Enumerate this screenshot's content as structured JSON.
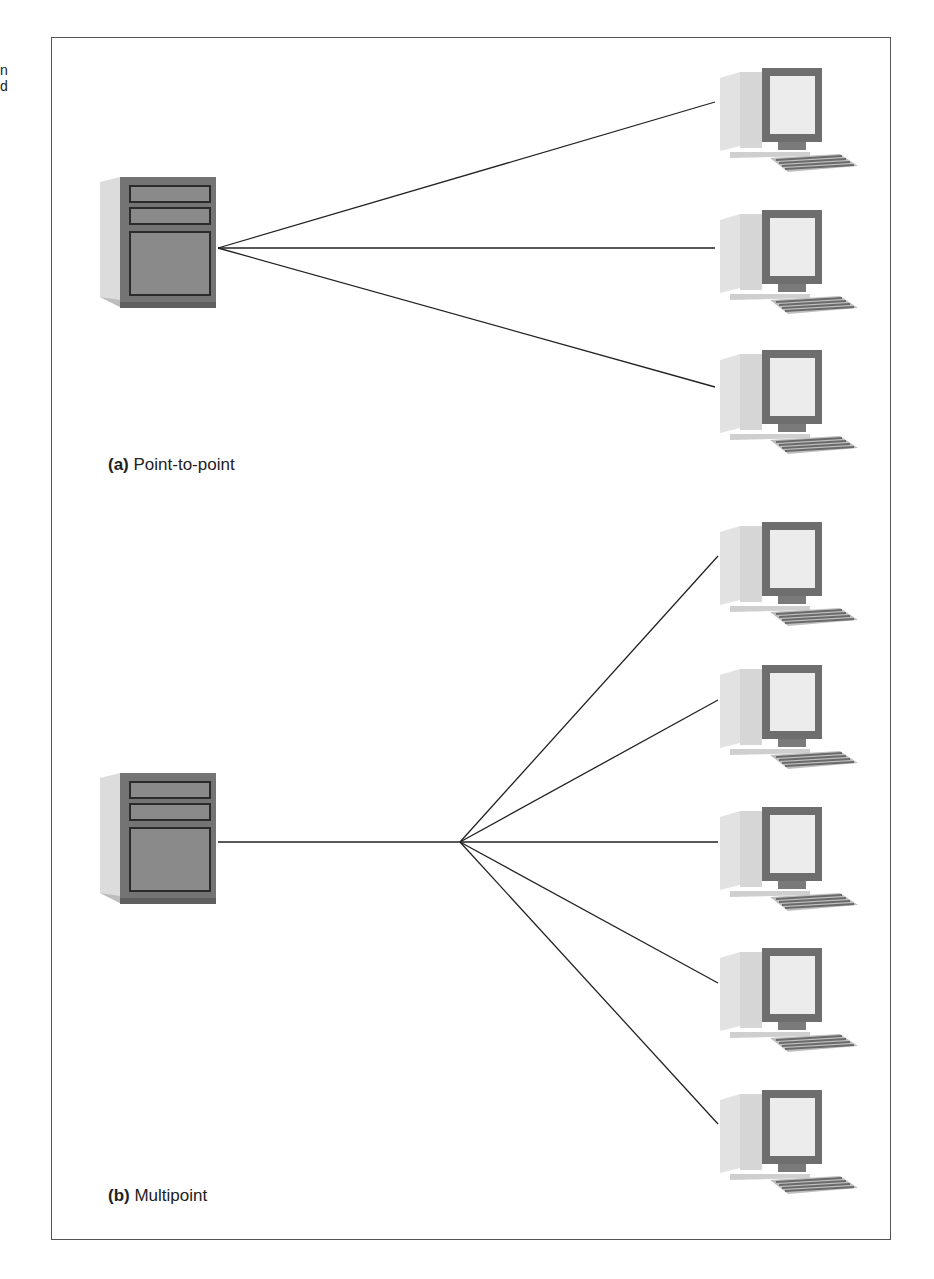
{
  "edge_fragment": [
    "n",
    "d"
  ],
  "panels": [
    {
      "id": "a",
      "label": "(a)",
      "title": "Point-to-point",
      "server": {
        "x": 90,
        "y": 175,
        "connector": [
          218,
          248
        ]
      },
      "terminals": [
        {
          "x": 710,
          "y": 66,
          "endpoint": [
            715,
            102
          ]
        },
        {
          "x": 710,
          "y": 206,
          "endpoint": [
            715,
            248
          ]
        },
        {
          "x": 710,
          "y": 350,
          "endpoint": [
            715,
            387
          ]
        }
      ]
    },
    {
      "id": "b",
      "label": "(b)",
      "title": "Multipoint",
      "server": {
        "x": 90,
        "y": 770,
        "connector": [
          218,
          842
        ]
      },
      "hub": [
        460,
        842
      ],
      "terminals": [
        {
          "x": 710,
          "y": 520,
          "endpoint": [
            718,
            556
          ]
        },
        {
          "x": 710,
          "y": 663,
          "endpoint": [
            718,
            700
          ]
        },
        {
          "x": 710,
          "y": 805,
          "endpoint": [
            718,
            842
          ]
        },
        {
          "x": 710,
          "y": 946,
          "endpoint": [
            718,
            983
          ]
        },
        {
          "x": 710,
          "y": 1088,
          "endpoint": [
            718,
            1124
          ]
        }
      ]
    }
  ],
  "colors": {
    "frame": "#555555",
    "line": "#222222",
    "device_dark": "#6e6e6e",
    "device_light": "#d9d9d9"
  }
}
